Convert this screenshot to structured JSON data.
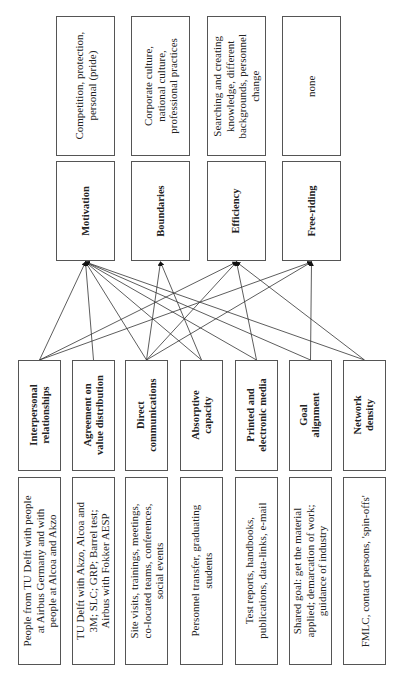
{
  "outcomes": [
    {
      "label": "Motivation",
      "description": "Competition, protection,\npersonal (pride)"
    },
    {
      "label": "Boundaries",
      "description": "Corporate culture,\nnational culture,\nprofessional practices"
    },
    {
      "label": "Efficiency",
      "description": "Searching and creating\nknowledge, different\nbackgrounds, personnel\nchange"
    },
    {
      "label": "Free-riding",
      "description": "none"
    }
  ],
  "factors": [
    {
      "label": "Interpersonal\nrelationships",
      "description": "People from TU Delft with people\nat Airbus Germany and with\npeople at Alcoa and Akzo"
    },
    {
      "label": "Agreement on\nvalue distribution",
      "description": "TU Delft with Akzo, Alcoa and\n3M; SLC; GRP; Barrel test;\nAirbus with Fokker AESP"
    },
    {
      "label": "Direct\ncommunications",
      "description": "Site visits, trainings, meetings,\nco-located teams, conferences,\nsocial events"
    },
    {
      "label": "Absorptive\ncapacity",
      "description": "Personnel transfer, graduating\nstudents"
    },
    {
      "label": "Printed and\nelectronic media",
      "description": "Test reports, handbooks,\npublications, data-links, e-mail"
    },
    {
      "label": "Goal\nalignment",
      "description": "Shared goal: get the material\napplied; demarcation of work;\nguidance of industry"
    },
    {
      "label": "Network\ndensity",
      "description": "FMLC, contact persons, 'spin-offs'"
    }
  ],
  "edges": [
    [
      0,
      0
    ],
    [
      0,
      2
    ],
    [
      0,
      3
    ],
    [
      1,
      0
    ],
    [
      2,
      0
    ],
    [
      2,
      1
    ],
    [
      2,
      2
    ],
    [
      2,
      3
    ],
    [
      3,
      0
    ],
    [
      3,
      1
    ],
    [
      4,
      0
    ],
    [
      4,
      2
    ],
    [
      5,
      0
    ],
    [
      5,
      3
    ],
    [
      6,
      0
    ],
    [
      6,
      2
    ]
  ]
}
